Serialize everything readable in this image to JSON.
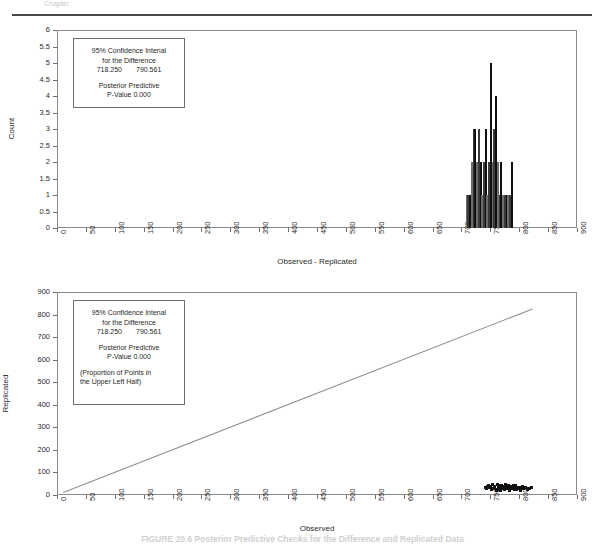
{
  "page": {
    "top_fragment": "Chapter",
    "caption": "FIGURE 20.6   Posterior Predictive Checks for the Difference and Replicated Data"
  },
  "annotation": {
    "line1": "95% Confidence Intenal",
    "line2": "for the Difference",
    "ci_low": "718.250",
    "ci_high": "790.561",
    "line3": "Posterior Predictive",
    "line4": "P-Value 0.000",
    "line5": "(Proportion of Points in",
    "line6": "the Upper Left Half)"
  },
  "chart_data": [
    {
      "id": "histogram",
      "type": "bar",
      "title": "",
      "xlabel": "Observed - Replicated",
      "ylabel": "Count",
      "xlim": [
        0,
        900
      ],
      "ylim": [
        0,
        6
      ],
      "xticks": [
        0,
        50,
        100,
        150,
        200,
        250,
        300,
        350,
        400,
        450,
        500,
        550,
        600,
        650,
        700,
        750,
        800,
        850,
        900
      ],
      "yticks": [
        0,
        0.5,
        1,
        1.5,
        2,
        2.5,
        3,
        3.5,
        4,
        4.5,
        5,
        5.5,
        6
      ],
      "grid": false,
      "legend": "none",
      "bin_width": 3,
      "categories": [
        709,
        712,
        715,
        718,
        721,
        724,
        727,
        730,
        733,
        736,
        739,
        742,
        745,
        748,
        751,
        754,
        757,
        760,
        763,
        766,
        769,
        772,
        775,
        778,
        781,
        784,
        787,
        790
      ],
      "values": [
        1,
        1,
        1,
        2,
        3,
        3,
        2,
        3,
        2,
        1,
        2,
        3,
        1,
        2,
        5,
        2,
        3,
        4,
        2,
        1,
        2,
        1,
        1,
        1,
        1,
        1,
        2,
        0
      ]
    },
    {
      "id": "scatter",
      "type": "scatter",
      "title": "",
      "xlabel": "Observed",
      "ylabel": "Replicated",
      "xlim": [
        0,
        900
      ],
      "ylim": [
        0,
        900
      ],
      "xticks": [
        0,
        50,
        100,
        150,
        200,
        250,
        300,
        350,
        400,
        450,
        500,
        550,
        600,
        650,
        700,
        750,
        800,
        850,
        900
      ],
      "yticks": [
        0,
        100,
        200,
        300,
        400,
        500,
        600,
        700,
        800,
        900
      ],
      "grid": false,
      "legend": "none",
      "reference_line": {
        "name": "y = x",
        "x": [
          10,
          822
        ],
        "y": [
          12,
          825
        ]
      },
      "points": [
        [
          741,
          34
        ],
        [
          744,
          28
        ],
        [
          747,
          41
        ],
        [
          749,
          33
        ],
        [
          752,
          25
        ],
        [
          754,
          45
        ],
        [
          756,
          30
        ],
        [
          758,
          38
        ],
        [
          760,
          22
        ],
        [
          762,
          48
        ],
        [
          764,
          35
        ],
        [
          766,
          27
        ],
        [
          768,
          43
        ],
        [
          770,
          31
        ],
        [
          772,
          39
        ],
        [
          774,
          24
        ],
        [
          776,
          46
        ],
        [
          778,
          36
        ],
        [
          780,
          29
        ],
        [
          782,
          42
        ],
        [
          784,
          20
        ],
        [
          786,
          37
        ],
        [
          788,
          32
        ],
        [
          790,
          44
        ],
        [
          792,
          26
        ],
        [
          794,
          40
        ],
        [
          796,
          23
        ],
        [
          798,
          34
        ],
        [
          800,
          30
        ],
        [
          802,
          21
        ],
        [
          805,
          38
        ],
        [
          808,
          27
        ],
        [
          811,
          33
        ],
        [
          814,
          25
        ],
        [
          818,
          31
        ],
        [
          822,
          35
        ],
        [
          751,
          37
        ],
        [
          763,
          26
        ],
        [
          775,
          33
        ],
        [
          787,
          28
        ],
        [
          757,
          29
        ],
        [
          769,
          44
        ],
        [
          781,
          31
        ],
        [
          793,
          35
        ],
        [
          745,
          36
        ],
        [
          767,
          21
        ],
        [
          779,
          40
        ],
        [
          791,
          24
        ],
        [
          803,
          32
        ],
        [
          815,
          29
        ]
      ]
    }
  ]
}
